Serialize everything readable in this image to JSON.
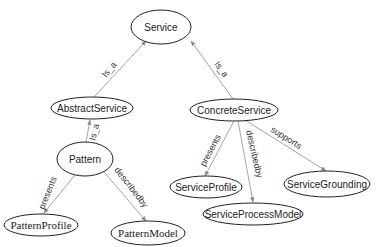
{
  "diagram": {
    "type": "ontology-graph",
    "nodes": [
      {
        "id": "service",
        "label": "Service"
      },
      {
        "id": "abstract_service",
        "label": "AbstractService"
      },
      {
        "id": "concrete_service",
        "label": "ConcreteService"
      },
      {
        "id": "pattern",
        "label": "Pattern"
      },
      {
        "id": "pattern_profile",
        "label": "PatternProfile"
      },
      {
        "id": "pattern_model",
        "label": "PatternModel"
      },
      {
        "id": "service_profile",
        "label": "ServiceProfile"
      },
      {
        "id": "service_process_model",
        "label": "ServiceProcessModel"
      },
      {
        "id": "service_grounding",
        "label": "ServiceGrounding"
      }
    ],
    "edges": [
      {
        "from": "abstract_service",
        "to": "service",
        "label": "Is_a"
      },
      {
        "from": "concrete_service",
        "to": "service",
        "label": "Is_a"
      },
      {
        "from": "pattern",
        "to": "abstract_service",
        "label": "Is_a"
      },
      {
        "from": "pattern",
        "to": "pattern_profile",
        "label": "presents"
      },
      {
        "from": "pattern",
        "to": "pattern_model",
        "label": "describedby"
      },
      {
        "from": "concrete_service",
        "to": "service_profile",
        "label": "presents"
      },
      {
        "from": "concrete_service",
        "to": "service_process_model",
        "label": "describedby"
      },
      {
        "from": "concrete_service",
        "to": "service_grounding",
        "label": "supports"
      }
    ]
  }
}
